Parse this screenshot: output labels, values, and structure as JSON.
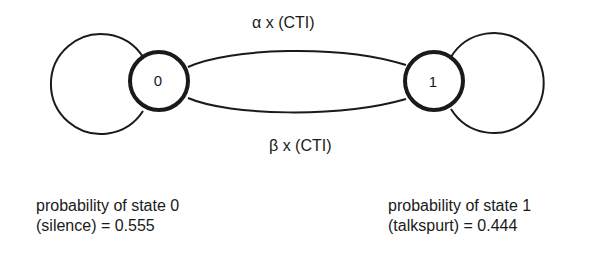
{
  "diagram": {
    "type": "markov-chain",
    "states": [
      {
        "id": "0",
        "label": "0"
      },
      {
        "id": "1",
        "label": "1"
      }
    ],
    "transitions": [
      {
        "from": "0",
        "to": "1",
        "label": "α x (CTI)"
      },
      {
        "from": "1",
        "to": "0",
        "label": "β x (CTI)"
      },
      {
        "from": "0",
        "to": "0",
        "label": ""
      },
      {
        "from": "1",
        "to": "1",
        "label": ""
      }
    ],
    "edge_labels": {
      "alpha": "α x (CTI)",
      "beta": "β x (CTI)"
    },
    "probabilities": {
      "state0": {
        "line1": "probability of state 0",
        "line2": "(silence) = 0.555"
      },
      "state1": {
        "line1": "probability of state 1",
        "line2": "(talkspurt) = 0.444"
      }
    }
  }
}
